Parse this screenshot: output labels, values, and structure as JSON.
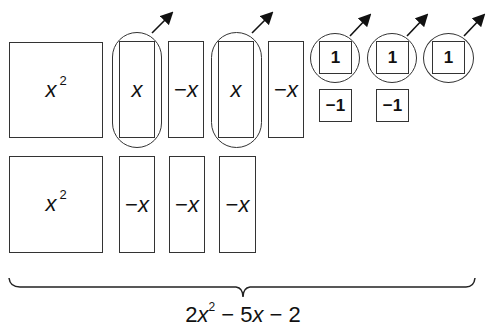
{
  "row1": {
    "tiles": [
      {
        "label": "x",
        "sup": "2",
        "type": "x-squared"
      },
      {
        "label": "x",
        "type": "x",
        "circled": true
      },
      {
        "label": "x",
        "neg": "−",
        "type": "neg-x"
      },
      {
        "label": "x",
        "type": "x",
        "circled": true
      },
      {
        "label": "x",
        "neg": "−",
        "type": "neg-x"
      },
      {
        "label": "1",
        "type": "one",
        "circled": true
      },
      {
        "label": "1",
        "type": "one",
        "circled": true
      },
      {
        "label": "1",
        "type": "one",
        "circled": true
      }
    ],
    "neg_units": [
      {
        "label": "−1",
        "type": "neg-one"
      },
      {
        "label": "−1",
        "type": "neg-one"
      }
    ]
  },
  "row2": {
    "tiles": [
      {
        "label": "x",
        "sup": "2",
        "type": "x-squared"
      },
      {
        "label": "x",
        "neg": "−",
        "type": "neg-x"
      },
      {
        "label": "x",
        "neg": "−",
        "type": "neg-x"
      },
      {
        "label": "x",
        "neg": "−",
        "type": "neg-x"
      }
    ]
  },
  "expression": {
    "coef1": "2",
    "var1": "x",
    "exp1": "2",
    "op1": " − ",
    "coef2": "5",
    "var2": "x",
    "op2": " − ",
    "const": "2"
  },
  "colors": {
    "stroke": "#333333",
    "background": "#ffffff"
  }
}
